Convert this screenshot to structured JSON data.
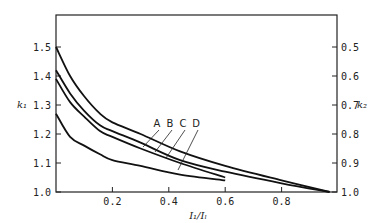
{
  "chart_data": {
    "type": "line",
    "title": "",
    "xlabel": "I₁/Iₗ",
    "ylabel": "k₁",
    "y2label": "k₂",
    "xlim": [
      0,
      1.0
    ],
    "ylim": [
      1.0,
      1.6
    ],
    "y2lim": [
      1.0,
      0.4
    ],
    "x_ticks": [
      "0.2",
      "0.4",
      "0.6",
      "0.8"
    ],
    "y_ticks": [
      "1.0",
      "1.1",
      "1.2",
      "1.3",
      "1.4",
      "1.5"
    ],
    "y2_ticks": [
      "1.0",
      "0.9",
      "0.8",
      "0.7",
      "0.6",
      "0.5"
    ],
    "grid": false,
    "legend": "inline labels A, B, C, D with leader lines",
    "series": [
      {
        "name": "A",
        "x": [
          0.0,
          0.05,
          0.1,
          0.156,
          0.2,
          0.3,
          0.44,
          0.6,
          0.8,
          0.97
        ],
        "values": [
          1.5,
          1.4,
          1.33,
          1.27,
          1.24,
          1.2,
          1.14,
          1.09,
          1.04,
          1.0
        ]
      },
      {
        "name": "B",
        "x": [
          0.0,
          0.05,
          0.1,
          0.156,
          0.2,
          0.3,
          0.44,
          0.6,
          0.8,
          0.97
        ],
        "values": [
          1.42,
          1.34,
          1.28,
          1.23,
          1.21,
          1.17,
          1.11,
          1.07,
          1.03,
          1.0
        ]
      },
      {
        "name": "C",
        "x": [
          0.0,
          0.05,
          0.1,
          0.156,
          0.2,
          0.3,
          0.44,
          0.6
        ],
        "values": [
          1.39,
          1.31,
          1.26,
          1.21,
          1.19,
          1.15,
          1.1,
          1.05
        ]
      },
      {
        "name": "D",
        "x": [
          0.0,
          0.05,
          0.1,
          0.156,
          0.2,
          0.3,
          0.44,
          0.6
        ],
        "values": [
          1.27,
          1.19,
          1.16,
          1.13,
          1.11,
          1.09,
          1.06,
          1.04
        ]
      }
    ]
  }
}
